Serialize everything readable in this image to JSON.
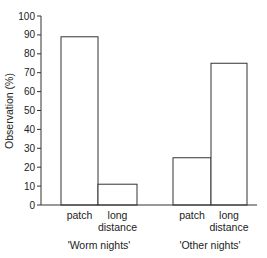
{
  "chart_data": {
    "type": "bar",
    "title": "",
    "xlabel": "",
    "ylabel": "Observation (%)",
    "ylim": [
      0,
      100
    ],
    "yticks": [
      0,
      10,
      20,
      30,
      40,
      50,
      60,
      70,
      80,
      90,
      100
    ],
    "grid": false,
    "legend": null,
    "groups": [
      {
        "name": "'Worm nights'",
        "bars": [
          {
            "label": "patch",
            "value": 89
          },
          {
            "label": "long distance",
            "value": 11
          }
        ]
      },
      {
        "name": "'Other nights'",
        "bars": [
          {
            "label": "patch",
            "value": 25
          },
          {
            "label": "long distance",
            "value": 75
          }
        ]
      }
    ],
    "categories": [
      "patch",
      "long distance",
      "patch",
      "long distance"
    ],
    "values": [
      89,
      11,
      25,
      75
    ]
  },
  "labels": {
    "ylabel": "Observation (%)",
    "group1": "'Worm nights'",
    "group2": "'Other nights'",
    "patch": "patch",
    "long": "long",
    "distance": "distance"
  },
  "style": {
    "bar_fill": "#ffffff",
    "bar_stroke": "#333333",
    "axis_color": "#333333"
  }
}
